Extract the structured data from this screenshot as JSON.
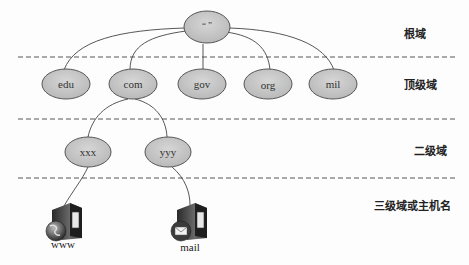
{
  "diagram": {
    "type": "dns-hierarchy-tree",
    "root": {
      "label": "“ ”"
    },
    "levels": [
      {
        "label": "根域"
      },
      {
        "label": "顶级域"
      },
      {
        "label": "二级域"
      },
      {
        "label": "三级域或主机名"
      }
    ],
    "top_level_domains": [
      {
        "label": "edu"
      },
      {
        "label": "com"
      },
      {
        "label": "gov"
      },
      {
        "label": "org"
      },
      {
        "label": "mil"
      }
    ],
    "second_level_domains": [
      {
        "label": "xxx",
        "parent": "com"
      },
      {
        "label": "yyy",
        "parent": "com"
      }
    ],
    "hosts": [
      {
        "label": "www",
        "parent": "xxx",
        "icon": "web-server-globe-icon"
      },
      {
        "label": "mail",
        "parent": "yyy",
        "icon": "mail-server-envelope-icon"
      }
    ],
    "colors": {
      "node_fill": "#c8c8c8",
      "node_stroke": "#555555",
      "edge": "#444444",
      "dashed_line": "#555555"
    }
  }
}
